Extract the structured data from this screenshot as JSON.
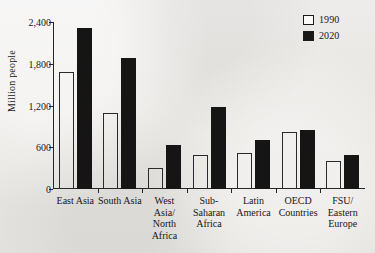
{
  "chart_data": {
    "type": "bar",
    "title": "",
    "xlabel": "",
    "ylabel": "Million people",
    "ylim": [
      0,
      2400
    ],
    "yticks": [
      0,
      600,
      1200,
      1800,
      2400
    ],
    "ytick_labels": [
      "0",
      "600",
      "1,200",
      "1,800",
      "2,400"
    ],
    "grid": false,
    "legend_position": "top-right",
    "categories": [
      "East Asia",
      "South Asia",
      "West\nAsia/\nNorth\nAfrica",
      "Sub-\nSaharan\nAfrica",
      "Latin\nAmerica",
      "OECD\nCountries",
      "FSU/\nEastern\nEurope"
    ],
    "series": [
      {
        "name": "1990",
        "color": "#ffffff",
        "values": [
          1680,
          1090,
          300,
          490,
          515,
          820,
          400
        ]
      },
      {
        "name": "2020",
        "color": "#151515",
        "values": [
          2310,
          1880,
          630,
          1175,
          700,
          850,
          490
        ]
      }
    ]
  },
  "legend": {
    "items": [
      {
        "label": "1990",
        "swatch": "open-square-icon"
      },
      {
        "label": "2020",
        "swatch": "filled-square-icon"
      }
    ]
  },
  "colors": {
    "background": "#e9e7e3",
    "axis": "#26262a",
    "text": "#17161a",
    "bar_1990": "#ffffff",
    "bar_2020": "#151515"
  }
}
